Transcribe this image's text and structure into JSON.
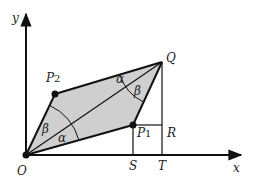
{
  "diagram": {
    "type": "geometry",
    "axes": {
      "x_label": "x",
      "y_label": "y",
      "origin_label": "O"
    },
    "points": {
      "O": {
        "label": "O",
        "px": [
          26,
          155
        ]
      },
      "P1": {
        "label": "P",
        "sub": "1",
        "px": [
          133,
          125
        ]
      },
      "P2": {
        "label": "P",
        "sub": "2",
        "px": [
          55,
          94
        ]
      },
      "Q": {
        "label": "Q",
        "px": [
          162,
          62
        ]
      },
      "R": {
        "label": "R",
        "px": [
          162,
          125
        ]
      },
      "S": {
        "label": "S",
        "px": [
          133,
          155
        ]
      },
      "T": {
        "label": "T",
        "px": [
          162,
          155
        ]
      }
    },
    "angles": {
      "alpha_at_O": "α",
      "beta_at_O": "β",
      "alpha_at_Q": "α",
      "beta_at_Q": "β"
    },
    "colors": {
      "fill": "#cfcfcf",
      "stroke": "#111111"
    }
  }
}
